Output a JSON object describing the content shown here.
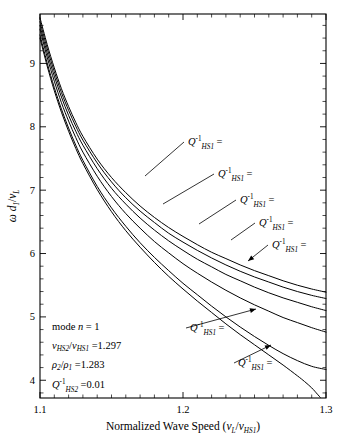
{
  "chart_data": {
    "type": "line",
    "title": "",
    "xlabel_parts": {
      "main": "Normalized Wave Speed",
      "paren_open": "(",
      "v": "v",
      "vsub": "L",
      "slash": "/",
      "v2": "v",
      "v2sub": "HS1",
      "paren_close": ")"
    },
    "ylabel_parts": {
      "omega": "ω",
      "d": "d",
      "dsub": "1",
      "slash": "/",
      "v": "v",
      "vsub": "L"
    },
    "xlim": [
      1.1,
      1.3
    ],
    "ylim": [
      3.72,
      9.78
    ],
    "xticks": [
      1.1,
      1.2,
      1.3
    ],
    "xticklabels": [
      "1.1",
      "1.2",
      "1.3"
    ],
    "xminor_step": 0.01,
    "yticks": [
      4,
      5,
      6,
      7,
      8,
      9
    ],
    "yticklabels": [
      "4",
      "5",
      "6",
      "7",
      "8",
      "9"
    ],
    "yminor_step": 0.2,
    "grid": false,
    "legend_position": "inline-annotations",
    "series": [
      {
        "name": "Qinv_HS1 = 0.1",
        "label_value": "0.1",
        "points": [
          [
            1.1,
            9.72
          ],
          [
            1.105,
            9.3
          ],
          [
            1.11,
            8.93
          ],
          [
            1.115,
            8.6
          ],
          [
            1.12,
            8.32
          ],
          [
            1.125,
            8.07
          ],
          [
            1.13,
            7.85
          ],
          [
            1.14,
            7.49
          ],
          [
            1.15,
            7.2
          ],
          [
            1.16,
            6.96
          ],
          [
            1.17,
            6.75
          ],
          [
            1.18,
            6.57
          ],
          [
            1.19,
            6.41
          ],
          [
            1.2,
            6.27
          ],
          [
            1.21,
            6.14
          ],
          [
            1.22,
            6.02
          ],
          [
            1.23,
            5.92
          ],
          [
            1.24,
            5.82
          ],
          [
            1.25,
            5.73
          ],
          [
            1.26,
            5.65
          ],
          [
            1.27,
            5.57
          ],
          [
            1.28,
            5.5
          ],
          [
            1.29,
            5.44
          ],
          [
            1.3,
            5.39
          ]
        ]
      },
      {
        "name": "Qinv_HS1 = 0.2",
        "label_value": "0.2",
        "points": [
          [
            1.1,
            9.66
          ],
          [
            1.105,
            9.24
          ],
          [
            1.11,
            8.87
          ],
          [
            1.115,
            8.54
          ],
          [
            1.12,
            8.26
          ],
          [
            1.125,
            8.01
          ],
          [
            1.13,
            7.79
          ],
          [
            1.14,
            7.43
          ],
          [
            1.15,
            7.13
          ],
          [
            1.16,
            6.88
          ],
          [
            1.17,
            6.67
          ],
          [
            1.18,
            6.49
          ],
          [
            1.19,
            6.32
          ],
          [
            1.2,
            6.18
          ],
          [
            1.21,
            6.05
          ],
          [
            1.22,
            5.93
          ],
          [
            1.23,
            5.82
          ],
          [
            1.24,
            5.72
          ],
          [
            1.25,
            5.63
          ],
          [
            1.26,
            5.55
          ],
          [
            1.27,
            5.47
          ],
          [
            1.28,
            5.4
          ],
          [
            1.29,
            5.34
          ],
          [
            1.3,
            5.29
          ]
        ]
      },
      {
        "name": "Qinv_HS1 = 0.3",
        "label_value": "0.3",
        "points": [
          [
            1.1,
            9.6
          ],
          [
            1.105,
            9.17
          ],
          [
            1.11,
            8.8
          ],
          [
            1.115,
            8.47
          ],
          [
            1.12,
            8.18
          ],
          [
            1.125,
            7.93
          ],
          [
            1.13,
            7.71
          ],
          [
            1.14,
            7.34
          ],
          [
            1.15,
            7.03
          ],
          [
            1.16,
            6.78
          ],
          [
            1.17,
            6.56
          ],
          [
            1.18,
            6.37
          ],
          [
            1.19,
            6.2
          ],
          [
            1.2,
            6.05
          ],
          [
            1.21,
            5.91
          ],
          [
            1.22,
            5.79
          ],
          [
            1.23,
            5.67
          ],
          [
            1.24,
            5.57
          ],
          [
            1.25,
            5.47
          ],
          [
            1.26,
            5.38
          ],
          [
            1.27,
            5.3
          ],
          [
            1.28,
            5.23
          ],
          [
            1.29,
            5.16
          ],
          [
            1.3,
            5.1
          ]
        ]
      },
      {
        "name": "Qinv_HS1 = 0.4",
        "label_value": "0.4",
        "points": [
          [
            1.1,
            9.54
          ],
          [
            1.105,
            9.1
          ],
          [
            1.11,
            8.72
          ],
          [
            1.115,
            8.38
          ],
          [
            1.12,
            8.09
          ],
          [
            1.125,
            7.83
          ],
          [
            1.13,
            7.6
          ],
          [
            1.14,
            7.22
          ],
          [
            1.15,
            6.9
          ],
          [
            1.16,
            6.63
          ],
          [
            1.17,
            6.4
          ],
          [
            1.18,
            6.19
          ],
          [
            1.19,
            6.01
          ],
          [
            1.2,
            5.84
          ],
          [
            1.21,
            5.69
          ],
          [
            1.22,
            5.55
          ],
          [
            1.23,
            5.42
          ],
          [
            1.24,
            5.3
          ],
          [
            1.25,
            5.19
          ],
          [
            1.26,
            5.09
          ],
          [
            1.27,
            4.99
          ],
          [
            1.28,
            4.91
          ],
          [
            1.29,
            4.83
          ],
          [
            1.3,
            4.76
          ]
        ]
      },
      {
        "name": "Qinv_HS1 = 0.01",
        "label_value": "0.01",
        "points": [
          [
            1.1,
            9.45
          ],
          [
            1.105,
            9.01
          ],
          [
            1.11,
            8.62
          ],
          [
            1.115,
            8.28
          ],
          [
            1.12,
            7.98
          ],
          [
            1.125,
            7.71
          ],
          [
            1.13,
            7.47
          ],
          [
            1.14,
            7.06
          ],
          [
            1.15,
            6.72
          ],
          [
            1.16,
            6.43
          ],
          [
            1.17,
            6.17
          ],
          [
            1.18,
            5.94
          ],
          [
            1.19,
            5.73
          ],
          [
            1.2,
            5.53
          ],
          [
            1.21,
            5.35
          ],
          [
            1.22,
            5.17
          ],
          [
            1.23,
            5.0
          ],
          [
            1.24,
            4.84
          ],
          [
            1.25,
            4.69
          ],
          [
            1.26,
            4.55
          ],
          [
            1.27,
            4.42
          ],
          [
            1.28,
            4.31
          ],
          [
            1.29,
            4.22
          ],
          [
            1.3,
            4.17
          ]
        ]
      },
      {
        "name": "Qinv_HS1 = 0",
        "label_value": "0",
        "points": [
          [
            1.1,
            9.4
          ],
          [
            1.105,
            8.96
          ],
          [
            1.11,
            8.57
          ],
          [
            1.115,
            8.23
          ],
          [
            1.12,
            7.93
          ],
          [
            1.125,
            7.66
          ],
          [
            1.13,
            7.42
          ],
          [
            1.14,
            7.01
          ],
          [
            1.15,
            6.66
          ],
          [
            1.16,
            6.36
          ],
          [
            1.17,
            6.1
          ],
          [
            1.18,
            5.86
          ],
          [
            1.19,
            5.64
          ],
          [
            1.2,
            5.44
          ],
          [
            1.21,
            5.25
          ],
          [
            1.22,
            5.07
          ],
          [
            1.23,
            4.89
          ],
          [
            1.24,
            4.72
          ],
          [
            1.25,
            4.56
          ],
          [
            1.26,
            4.4
          ],
          [
            1.27,
            4.24
          ],
          [
            1.28,
            4.07
          ],
          [
            1.285,
            3.98
          ],
          [
            1.29,
            3.88
          ],
          [
            1.294,
            3.78
          ],
          [
            1.296,
            3.73
          ]
        ]
      }
    ],
    "curve_labels": [
      {
        "id": "q01",
        "text_value": "0.1",
        "x": 188,
        "y": 145,
        "anchor_x": 145,
        "anchor_y": 176,
        "arrow": false
      },
      {
        "id": "q02",
        "text_value": "0.2",
        "x": 218,
        "y": 177,
        "anchor_x": 163,
        "anchor_y": 204,
        "arrow": false
      },
      {
        "id": "q03",
        "text_value": "0.3",
        "x": 240,
        "y": 203,
        "anchor_x": 199,
        "anchor_y": 224,
        "arrow": false
      },
      {
        "id": "q04",
        "text_value": "0.4",
        "x": 259,
        "y": 226,
        "anchor_x": 231,
        "anchor_y": 240,
        "arrow": false
      },
      {
        "id": "q05",
        "text_value": "0.5",
        "x": 272,
        "y": 248,
        "anchor_x": 248,
        "anchor_y": 261,
        "arrow": true
      },
      {
        "id": "q001",
        "text_value": "0.01",
        "x": 190,
        "y": 331,
        "anchor_x": 256,
        "anchor_y": 309,
        "arrow": true
      },
      {
        "id": "q0",
        "text_value": "0",
        "x": 238,
        "y": 366,
        "anchor_x": 271,
        "anchor_y": 345,
        "arrow": true
      }
    ]
  },
  "annotation_block": {
    "line1": {
      "pre": "mode ",
      "it": "n",
      "eq": " =  1"
    },
    "line2": {
      "v1": "v",
      "v1sub": "HS2",
      "slash": "/",
      "v2": "v",
      "v2sub": "HS1",
      "eq": " =",
      "value": "1.297"
    },
    "line3": {
      "r1": "ρ",
      "r1sub": "2",
      "slash": "/",
      "r2": "ρ",
      "r2sub": "1",
      "eq": " =",
      "value": "1.283"
    },
    "line4": {
      "q": "Q",
      "sup": "-1",
      "sub": "HS2",
      "eq": " =",
      "value": "0.01"
    }
  },
  "symbols": {
    "Q": "Q",
    "inv": "-1",
    "hs1": "HS1",
    "eq": "="
  },
  "colors": {
    "ink": "#000000",
    "background": "#ffffff"
  }
}
